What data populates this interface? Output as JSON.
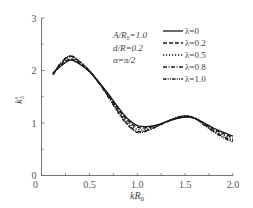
{
  "chart_data": {
    "type": "line",
    "title": "",
    "xlabel": "kR₀",
    "ylabel": "k₃⁽ˢ⁾",
    "xlim": [
      0,
      2.0
    ],
    "ylim": [
      0,
      3
    ],
    "x_ticks": [
      "0",
      "0.5",
      "1.0",
      "1.5",
      "2.0"
    ],
    "y_ticks": [
      "0",
      "1",
      "2",
      "3"
    ],
    "grid": false,
    "legend_position": "upper right",
    "annotations": [
      "A/R₀=1.0",
      "d/R=0.2",
      "α=π/2"
    ],
    "x": [
      0.12,
      0.2,
      0.3,
      0.4,
      0.5,
      0.6,
      0.7,
      0.8,
      0.9,
      1.0,
      1.1,
      1.2,
      1.3,
      1.4,
      1.5,
      1.6,
      1.7,
      1.8,
      1.9,
      2.0
    ],
    "series": [
      {
        "name": "λ=0",
        "style": "solid",
        "values": [
          1.95,
          2.08,
          2.2,
          2.12,
          1.98,
          1.78,
          1.55,
          1.3,
          1.08,
          0.95,
          0.93,
          0.96,
          1.02,
          1.08,
          1.11,
          1.09,
          1.0,
          0.9,
          0.82,
          0.75
        ]
      },
      {
        "name": "λ=0.2",
        "style": "dashed",
        "values": [
          1.94,
          2.1,
          2.22,
          2.13,
          1.98,
          1.77,
          1.53,
          1.27,
          1.05,
          0.92,
          0.91,
          0.95,
          1.02,
          1.08,
          1.12,
          1.09,
          0.99,
          0.88,
          0.8,
          0.72
        ]
      },
      {
        "name": "λ=0.5",
        "style": "dotted",
        "values": [
          1.93,
          2.12,
          2.26,
          2.15,
          1.99,
          1.77,
          1.52,
          1.25,
          1.02,
          0.88,
          0.88,
          0.94,
          1.02,
          1.09,
          1.13,
          1.1,
          0.98,
          0.86,
          0.77,
          0.69
        ]
      },
      {
        "name": "λ=0.8",
        "style": "dash-dot",
        "values": [
          1.92,
          2.13,
          2.27,
          2.16,
          1.99,
          1.76,
          1.5,
          1.22,
          0.98,
          0.84,
          0.86,
          0.93,
          1.02,
          1.09,
          1.13,
          1.09,
          0.97,
          0.84,
          0.74,
          0.66
        ]
      },
      {
        "name": "λ=1.0",
        "style": "dash-dot-dot",
        "values": [
          1.92,
          2.14,
          2.28,
          2.17,
          2.0,
          1.76,
          1.49,
          1.2,
          0.96,
          0.82,
          0.85,
          0.93,
          1.02,
          1.1,
          1.14,
          1.09,
          0.96,
          0.83,
          0.72,
          0.64
        ]
      }
    ]
  },
  "labels": {
    "xlabel_k": "k",
    "xlabel_R": "R",
    "xlabel_sub": "0",
    "ylabel_k": "k",
    "ylabel_sub": "3",
    "ylabel_sup": "s",
    "param1": "A/R₀=1.0",
    "param2": "d/R=0.2",
    "param3": "α=π/2"
  }
}
